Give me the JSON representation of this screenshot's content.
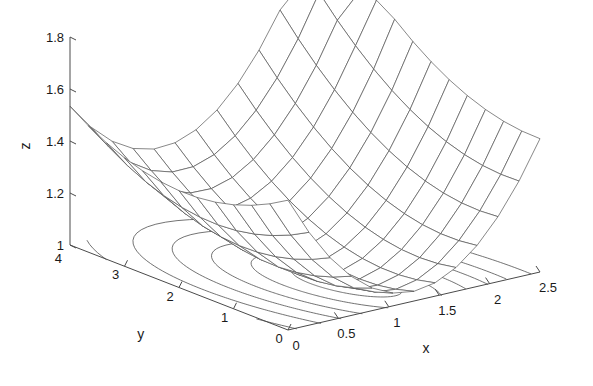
{
  "figure": {
    "background_color": "#ffffff",
    "line_color": "#555555",
    "axis_color": "#4a4a4a",
    "text_color": "#1a1a1a"
  },
  "chart_data": {
    "type": "surface",
    "title": "",
    "render": "mesh-wireframe-with-floor-contours",
    "xlabel": "x",
    "ylabel": "y",
    "zlabel": "z",
    "xlim": [
      0,
      2.5
    ],
    "ylim": [
      0,
      4
    ],
    "zlim": [
      1,
      1.8
    ],
    "xticks": [
      0,
      0.5,
      1,
      1.5,
      2,
      2.5
    ],
    "xticklabels": [
      "0",
      "0.5",
      "1",
      "1.5",
      "2",
      "2.5"
    ],
    "yticks": [
      0,
      1,
      2,
      3,
      4
    ],
    "yticklabels": [
      "0",
      "1",
      "2",
      "3",
      "4"
    ],
    "zticks": [
      1,
      1.2,
      1.4,
      1.6,
      1.8
    ],
    "zticklabels": [
      "1",
      "1.2",
      "1.4",
      "1.6",
      "1.8"
    ],
    "grid": false,
    "legend": false,
    "view": {
      "azimuth_deg": -37.5,
      "elevation_deg": 30
    },
    "surface": {
      "nx": 13,
      "ny": 13,
      "x_range": [
        0,
        2.5
      ],
      "y_range": [
        0,
        4
      ],
      "z_min": 1.0,
      "z_max": 1.8,
      "z_min_location": {
        "x": 1.15,
        "y": 1.05
      },
      "description": "bowl-shaped quadratic valley rising to 1.8 at the far corners"
    },
    "contours": {
      "count": 7,
      "levels": [
        1.02,
        1.06,
        1.12,
        1.2,
        1.3,
        1.45,
        1.62
      ],
      "projected_on": "z=1 floor",
      "shape": "concentric ellipses about the minimum"
    }
  },
  "labels": {
    "x_axis_name": "x",
    "y_axis_name": "y",
    "z_axis_name": "z"
  }
}
